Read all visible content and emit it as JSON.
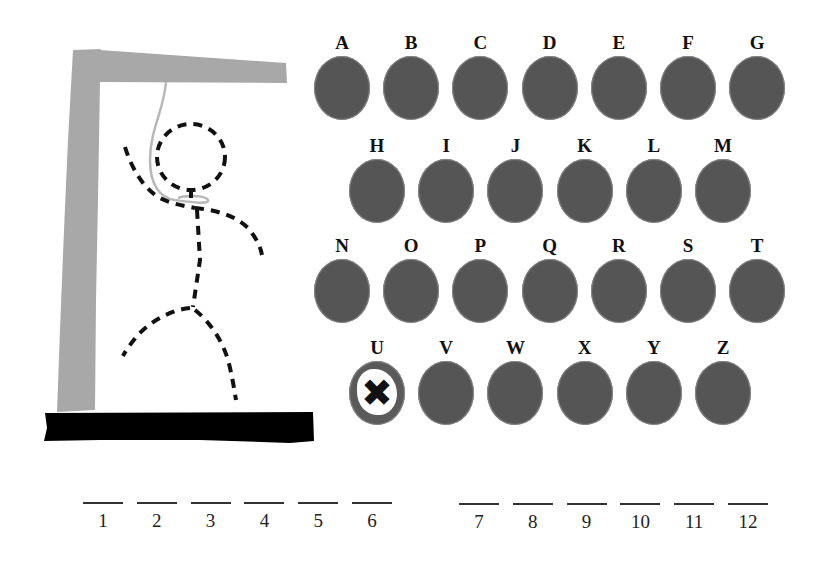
{
  "game": "hangman",
  "colors": {
    "gallows": "#a8a8a8",
    "base": "#000000",
    "disc": "#555555",
    "figure_dash": "#111111",
    "rope": "#b8b8b8"
  },
  "alphabet": {
    "rows": [
      [
        {
          "letter": "A",
          "state": "available"
        },
        {
          "letter": "B",
          "state": "available"
        },
        {
          "letter": "C",
          "state": "available"
        },
        {
          "letter": "D",
          "state": "available"
        },
        {
          "letter": "E",
          "state": "available"
        },
        {
          "letter": "F",
          "state": "available"
        },
        {
          "letter": "G",
          "state": "available"
        }
      ],
      [
        {
          "letter": "H",
          "state": "available"
        },
        {
          "letter": "I",
          "state": "available"
        },
        {
          "letter": "J",
          "state": "available"
        },
        {
          "letter": "K",
          "state": "available"
        },
        {
          "letter": "L",
          "state": "available"
        },
        {
          "letter": "M",
          "state": "available"
        }
      ],
      [
        {
          "letter": "N",
          "state": "available"
        },
        {
          "letter": "O",
          "state": "available"
        },
        {
          "letter": "P",
          "state": "available"
        },
        {
          "letter": "Q",
          "state": "available"
        },
        {
          "letter": "R",
          "state": "available"
        },
        {
          "letter": "S",
          "state": "available"
        },
        {
          "letter": "T",
          "state": "available"
        }
      ],
      [
        {
          "letter": "U",
          "state": "wrong",
          "mark": "✖"
        },
        {
          "letter": "V",
          "state": "available"
        },
        {
          "letter": "W",
          "state": "available"
        },
        {
          "letter": "X",
          "state": "available"
        },
        {
          "letter": "Y",
          "state": "available"
        },
        {
          "letter": "Z",
          "state": "available"
        }
      ]
    ]
  },
  "word": {
    "words": [
      {
        "slots": [
          "1",
          "2",
          "3",
          "4",
          "5",
          "6"
        ]
      },
      {
        "slots": [
          "7",
          "8",
          "9",
          "10",
          "11",
          "12"
        ]
      }
    ]
  },
  "figure": {
    "parts_shown": [
      "head",
      "body",
      "left-arm",
      "right-arm",
      "left-leg",
      "right-leg"
    ],
    "style": "dashed"
  }
}
